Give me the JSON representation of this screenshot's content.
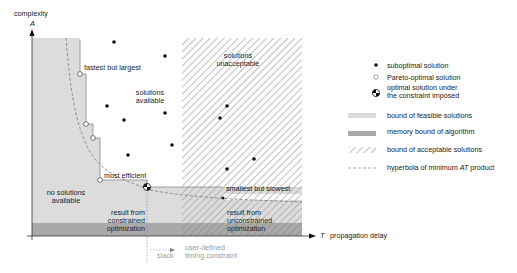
{
  "axes": {
    "y_label": "complexity",
    "y_symbol": "A",
    "x_symbol": "T",
    "x_label": "propagation delay"
  },
  "regions": {
    "no_solutions": [
      "no solutions",
      "available"
    ],
    "solutions_available": [
      "solutions",
      "available"
    ],
    "solutions_unacceptable": [
      "solutions",
      "unacceptable"
    ],
    "constrained": [
      "result from",
      "constrained",
      "optimization"
    ],
    "unconstrained": [
      "result from",
      "unconstrained",
      "optimization"
    ]
  },
  "annotations": {
    "fastest": "fastest but largest",
    "most_efficient": "most efficient",
    "smallest": "smallest but slowest",
    "slack": "slack",
    "timing": [
      "user-defined",
      "timing constraint"
    ]
  },
  "legend": {
    "items": [
      {
        "key": "suboptimal",
        "label": [
          "suboptimal solution"
        ]
      },
      {
        "key": "pareto",
        "label": [
          "Pareto-optimal solution"
        ]
      },
      {
        "key": "optimal",
        "label": [
          "optimal solution under",
          "the constraint imposed"
        ]
      },
      {
        "key": "feasible",
        "label": [
          "bound of feasible solutions"
        ]
      },
      {
        "key": "memory",
        "label": [
          "memory bound of algorithm"
        ]
      },
      {
        "key": "acceptable",
        "label": [
          "bound of acceptable solutions"
        ]
      },
      {
        "key": "hyperbola",
        "label_pre": "hyperbola of minimum ",
        "label_em": "AT",
        "label_post": " product"
      }
    ]
  },
  "colors": {
    "feasible_fill": "#dcdcdc",
    "memory_fill": "#a9a9a9",
    "hatch": "#9c9c9c",
    "axis": "#333333",
    "dashed": "#777777",
    "constraint_text": "#9a9a9a"
  }
}
